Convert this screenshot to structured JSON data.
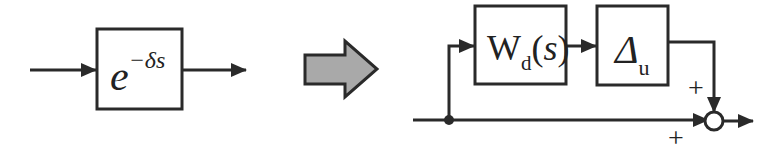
{
  "diagram": {
    "left": {
      "block": {
        "base": "e",
        "exponent": "−δs"
      }
    },
    "transform_arrow": {
      "color": "#a9a9a9",
      "stroke": "#2a2a2a"
    },
    "right": {
      "block1": {
        "main": "W",
        "sub": "d",
        "open": "(",
        "var": "s",
        "close": ")"
      },
      "block2": {
        "main": "Δ",
        "sub": "u"
      },
      "sum": {
        "sign_top": "+",
        "sign_bottom": "+"
      }
    },
    "colors": {
      "line": "#2a2a2a",
      "background": "#ffffff"
    }
  }
}
